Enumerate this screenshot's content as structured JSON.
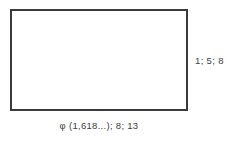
{
  "figure": {
    "name": "golden-rectangle-diagram",
    "background_color": "#ffffff",
    "rectangle": {
      "border_color": "#3a3a3a",
      "fill_color": "#ffffff",
      "border_width_px": 2
    },
    "labels": {
      "right_side": "1; 5; 8",
      "bottom_side": "φ (1,618...);  8;  13",
      "caption_remnant": ""
    },
    "text_color": "#3c3c3c"
  }
}
